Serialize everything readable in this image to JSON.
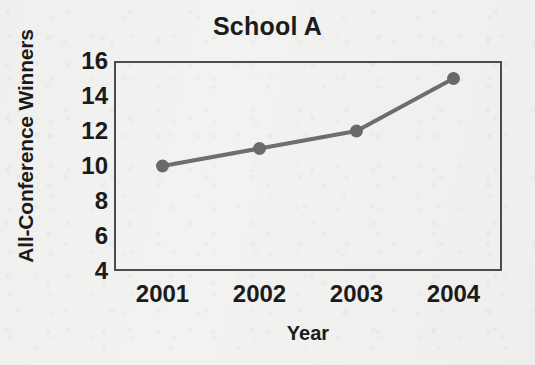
{
  "chart_data": {
    "type": "line",
    "title": "School A",
    "xlabel": "Year",
    "ylabel": "All-Conference Winners",
    "categories": [
      "2001",
      "2002",
      "2003",
      "2004"
    ],
    "values": [
      10,
      11,
      12,
      15
    ],
    "series": [
      {
        "name": "School A",
        "values": [
          10,
          11,
          12,
          15
        ]
      }
    ],
    "x": [
      2001,
      2002,
      2003,
      2004
    ],
    "ylim": [
      4,
      16
    ],
    "yticks": [
      4,
      6,
      8,
      10,
      12,
      14,
      16
    ],
    "ytick_labels": [
      "4",
      "6",
      "8",
      "10",
      "12",
      "14",
      "16"
    ],
    "xtick_labels": [
      "2001",
      "2002",
      "2003",
      "2004"
    ],
    "grid": false,
    "legend": false,
    "legend_position": "none",
    "marker": "circle",
    "colors": {
      "line": "#6e6e6e",
      "marker": "#6a6a6a",
      "axis": "#4c4c4c",
      "text": "#1b1b1b",
      "background": "#f2f2f0"
    }
  }
}
